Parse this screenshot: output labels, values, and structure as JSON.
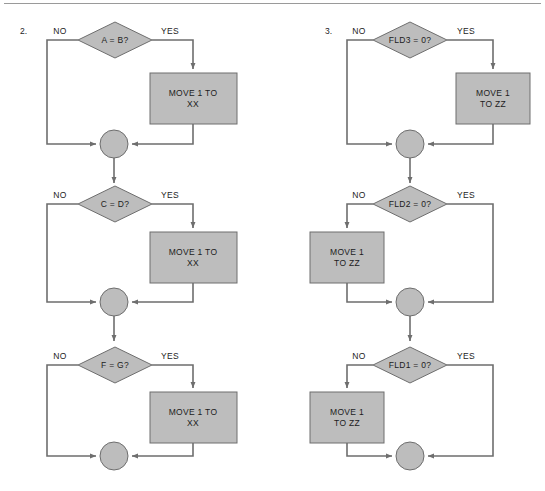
{
  "page": {
    "background_color": "#ffffff",
    "shape_fill_color": "#bdbdbd",
    "shape_stroke_color": "#6e6e6e",
    "text_color": "#1c1c1c",
    "rule_color": "#9a9a9a"
  },
  "labels": {
    "yes": "YES",
    "no": "NO"
  },
  "figures": [
    {
      "number": "2.",
      "sections": [
        {
          "decision": "A = B?",
          "process": "MOVE 1 TO\nXX",
          "process_line1": "MOVE 1 TO",
          "process_line2": "XX",
          "process_branch": "yes",
          "process_side": "right"
        },
        {
          "decision": "C = D?",
          "process": "MOVE 1 TO\nXX",
          "process_line1": "MOVE 1 TO",
          "process_line2": "XX",
          "process_branch": "yes",
          "process_side": "right"
        },
        {
          "decision": "F = G?",
          "process": "MOVE 1 TO\nXX",
          "process_line1": "MOVE 1 TO",
          "process_line2": "XX",
          "process_branch": "yes",
          "process_side": "right"
        }
      ]
    },
    {
      "number": "3.",
      "sections": [
        {
          "decision": "FLD3 = 0?",
          "process": "MOVE 1\nTO ZZ",
          "process_line1": "MOVE 1",
          "process_line2": "TO ZZ",
          "process_branch": "yes",
          "process_side": "right"
        },
        {
          "decision": "FLD2 = 0?",
          "process": "MOVE 1\nTO ZZ",
          "process_line1": "MOVE 1",
          "process_line2": "TO ZZ",
          "process_branch": "no",
          "process_side": "left"
        },
        {
          "decision": "FLD1 = 0?",
          "process": "MOVE 1\nTO ZZ",
          "process_line1": "MOVE 1",
          "process_line2": "TO ZZ",
          "process_branch": "no",
          "process_side": "left"
        }
      ]
    }
  ]
}
